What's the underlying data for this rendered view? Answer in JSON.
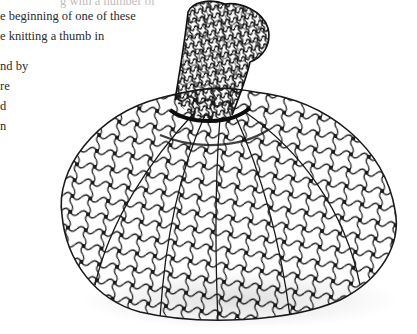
{
  "page": {
    "text_lines": [
      {
        "text": "g with a number of",
        "top": -9,
        "left": 60
      },
      {
        "text": "e beginning of one of these",
        "top": 6,
        "left": 0
      },
      {
        "text": "e knitting a thumb in",
        "top": 26,
        "left": 0
      },
      {
        "text": "nd by",
        "top": 56,
        "left": 0
      },
      {
        "text": "re",
        "top": 76,
        "left": 0
      },
      {
        "text": "d",
        "top": 96,
        "left": 0
      },
      {
        "text": "n",
        "top": 116,
        "left": 0
      }
    ]
  },
  "figure": {
    "wire_color": "#1a1a1a",
    "background_color": "#ffffff"
  }
}
